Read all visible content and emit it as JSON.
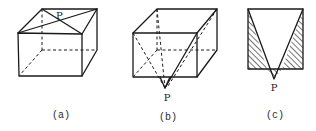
{
  "figures": [
    {
      "id": "a",
      "caption": "(a)",
      "point_label": "P",
      "description": "Cube with both diagonals of the top face drawn; P at their intersection"
    },
    {
      "id": "b",
      "caption": "(b)",
      "point_label": "P",
      "description": "Cube with point P below the bottom face, lines from P to top vertices"
    },
    {
      "id": "c",
      "caption": "(c)",
      "point_label": "P",
      "description": "Front view: rectangle with V-shape to P below, hatched triangular regions"
    }
  ],
  "colors": {
    "line": "#1a1a1a",
    "background": "#ffffff"
  }
}
